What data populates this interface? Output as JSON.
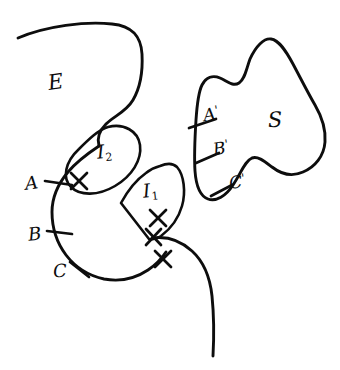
{
  "figure": {
    "background_color": "#ffffff",
    "ink_color": "#0d0d0d",
    "width": 340,
    "height": 370,
    "style": "hand-drawn pen sketch"
  },
  "labels": {
    "region_e": "E",
    "region_s": "S",
    "subregion_i2": "I",
    "subregion_i2_sub": "2",
    "subregion_i1": "I",
    "subregion_i1_sub": "1",
    "point_a": "A",
    "point_b": "B",
    "point_c": "C",
    "point_a_prime": "A",
    "point_b_prime": "B",
    "point_c_prime": "C",
    "prime_mark": "'"
  },
  "marks": {
    "cross_glyph": "X",
    "cross_count": 4,
    "tick_count_left": 3,
    "tick_count_right": 3
  },
  "annotations": {
    "left_boundary_points": [
      "A",
      "B",
      "C"
    ],
    "right_boundary_points": [
      "A'",
      "B'",
      "C'"
    ],
    "regions": [
      "E",
      "S",
      "I1",
      "I2"
    ]
  }
}
